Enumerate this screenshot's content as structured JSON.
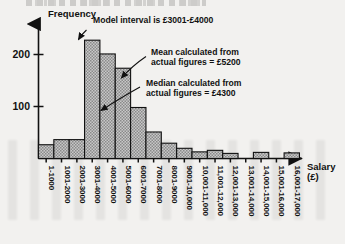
{
  "figure": {
    "y_axis_title": "Frequency",
    "x_axis_title_line1": "Salary",
    "x_axis_title_line2": "(£)"
  },
  "annotations": {
    "mode": {
      "line1": "Model interval is £3001-£4000",
      "line2": ""
    },
    "mean": {
      "line1": "Mean calculated from",
      "line2": "actual figures = £5200"
    },
    "median": {
      "line1": "Median calculated from",
      "line2": "actual figures = £4300"
    }
  },
  "chart_data": {
    "type": "bar",
    "title": "",
    "subtitle": "",
    "xlabel": "Salary (£)",
    "ylabel": "Frequency",
    "ylim": [
      0,
      250
    ],
    "yticks": [
      100,
      200
    ],
    "ytick_labels": [
      "100",
      "200"
    ],
    "grid": false,
    "legend": null,
    "categories": [
      "1-1000",
      "1001-2000",
      "2001-3000",
      "3001-4000",
      "4001-5000",
      "5001-6000",
      "6001-7000",
      "7001-8000",
      "8001-9000",
      "9001-10,000",
      "10,001-11,000",
      "11,001-12,000",
      "12,001-13,000",
      "13,001-14,000",
      "14,001-15,000",
      "15,001-16,000",
      "16,001-17,000"
    ],
    "values": [
      27,
      37,
      37,
      232,
      205,
      177,
      100,
      52,
      30,
      20,
      13,
      16,
      10,
      0,
      12,
      0,
      11
    ],
    "annotations": [
      "Model interval is £3001-£4000",
      "Mean calculated from actual figures = £5200",
      "Median calculated from actual figures = £4300"
    ]
  },
  "colors": {
    "ink": "#111111",
    "bar_fill": "#b9b9b9",
    "page": "#f2f1ef"
  }
}
